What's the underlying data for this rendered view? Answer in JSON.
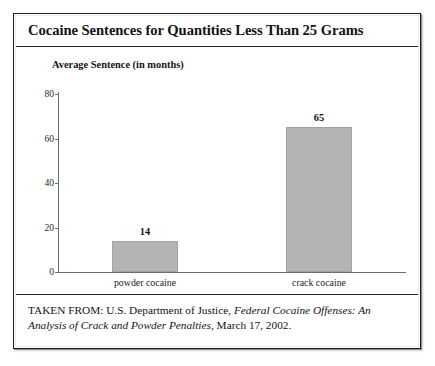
{
  "figure": {
    "title": "Cocaine Sentences for Quantities Less Than 25 Grams",
    "subtitle": "Average Sentence (in months)",
    "source_prefix": "TAKEN FROM: U.S. Department of Justice, ",
    "source_publication": "Federal Cocaine Offenses: An Analysis of Crack and Powder Penalties",
    "source_suffix": ", March 17, 2002."
  },
  "chart_data": {
    "type": "bar",
    "title": "Cocaine Sentences for Quantities Less Than 25 Grams",
    "subtitle": "Average Sentence (in months)",
    "xlabel": "",
    "ylabel": "Average Sentence (in months)",
    "ylim": [
      0,
      80
    ],
    "yticks": [
      0,
      20,
      40,
      60,
      80
    ],
    "ytick_labels": [
      "0",
      "20",
      "40",
      "60",
      "80"
    ],
    "grid": false,
    "legend": false,
    "bar_color": "#b4b4b4",
    "bar_border_color": "#a2a2a2",
    "categories": [
      "powder cocaine",
      "crack cocaine"
    ],
    "values": [
      14,
      65
    ],
    "value_labels": [
      "14",
      "65"
    ]
  }
}
